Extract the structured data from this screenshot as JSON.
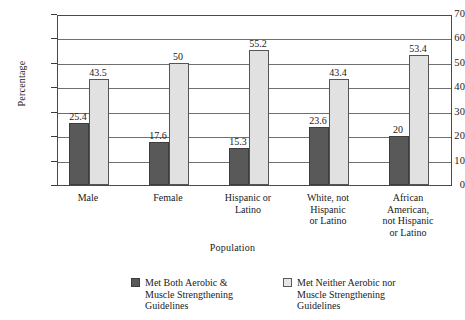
{
  "chart_data": {
    "type": "bar",
    "title": "",
    "xlabel": "Population",
    "ylabel": "Percentage",
    "ylim": [
      0,
      70
    ],
    "ytick_step": 10,
    "yticks": [
      0,
      10,
      20,
      30,
      40,
      50,
      60,
      70
    ],
    "grid": true,
    "legend_position": "bottom",
    "categories": [
      "Male",
      "Female",
      "Hispanic or Latino",
      "White, not Hispanic or Latino",
      "African American, not Hispanic or Latino"
    ],
    "category_label_lines": [
      [
        "Male"
      ],
      [
        "Female"
      ],
      [
        "Hispanic or",
        "Latino"
      ],
      [
        "White, not",
        "Hispanic",
        "or Latino"
      ],
      [
        "African",
        "American,",
        "not Hispanic",
        "or Latino"
      ]
    ],
    "series": [
      {
        "name": "Met Both Aerobic & Muscle Strengthening Guidelines",
        "name_lines": [
          "Met Both Aerobic &",
          "Muscle Strengthening",
          "Guidelines"
        ],
        "color": "#595959",
        "values": [
          25.4,
          17.6,
          15.3,
          23.6,
          20
        ],
        "value_labels": [
          "25.4",
          "17.6",
          "15.3",
          "23.6",
          "20"
        ]
      },
      {
        "name": "Met Neither Aerobic nor Muscle Strengthening Guidelines",
        "name_lines": [
          "Met Neither Aerobic nor",
          "Muscle Strengthening",
          "Guidelines"
        ],
        "color": "#e1e1e1",
        "values": [
          43.5,
          50,
          55.2,
          43.4,
          53.4
        ],
        "value_labels": [
          "43.5",
          "50",
          "55.2",
          "43.4",
          "53.4"
        ]
      }
    ]
  },
  "axes": {
    "y_tick_labels": [
      "70",
      "60",
      "50",
      "40",
      "30",
      "20",
      "10",
      "0"
    ],
    "y_title": "Percentage",
    "x_title": "Population"
  },
  "colors": {
    "series_dark": "#595959",
    "series_light": "#e1e1e1",
    "frame": "#4a4a4a",
    "gridline": "#6f6f6f",
    "text": "#1a1a1a",
    "background": "#ffffff"
  }
}
